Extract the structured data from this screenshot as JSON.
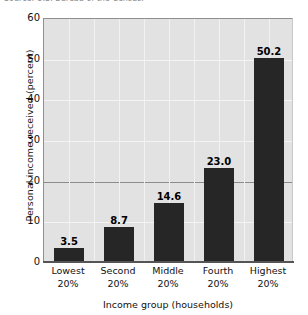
{
  "figure": {
    "top_caption_fragment": "Source: U.S. Bureau of the Census.",
    "background_color": "#ffffff",
    "plot_background_color": "#e2e2e2",
    "bar_color": "#262626",
    "reference_line_value": 20
  },
  "chart_data": {
    "type": "bar",
    "title": "",
    "xlabel": "Income group (households)",
    "ylabel": "Personal income received (percent)",
    "categories": [
      "Lowest\n20%",
      "Second\n20%",
      "Middle\n20%",
      "Fourth\n20%",
      "Highest\n20%"
    ],
    "category_lines": [
      [
        "Lowest",
        "20%"
      ],
      [
        "Second",
        "20%"
      ],
      [
        "Middle",
        "20%"
      ],
      [
        "Fourth",
        "20%"
      ],
      [
        "Highest",
        "20%"
      ]
    ],
    "values": [
      3.5,
      8.7,
      14.6,
      23.0,
      50.2
    ],
    "value_labels": [
      "3.5",
      "8.7",
      "14.6",
      "23.0",
      "50.2"
    ],
    "ylim": [
      0,
      60
    ],
    "yticks": [
      0,
      10,
      20,
      30,
      40,
      50,
      60
    ],
    "ytick_labels": [
      "0",
      "10",
      "20",
      "30",
      "40",
      "50",
      "60"
    ],
    "grid": true,
    "legend": null
  }
}
